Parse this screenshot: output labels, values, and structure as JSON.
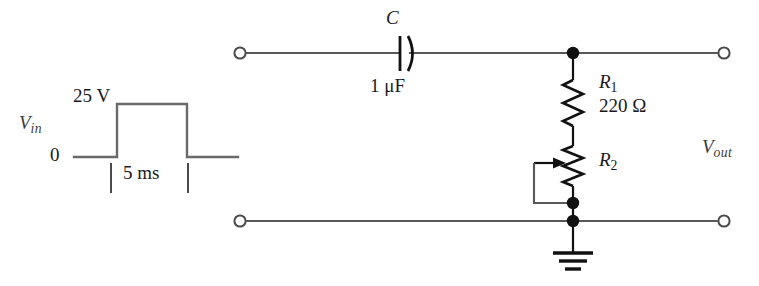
{
  "figure": {
    "colors": {
      "wire": "#595959",
      "component": "#111111",
      "label": "#3c3c3c",
      "background": "#ffffff"
    }
  },
  "waveform": {
    "signal_label": "V",
    "signal_label_sub": "in",
    "high_level": "25 V",
    "low_level": "0",
    "pulse_width": "5 ms",
    "type": "rectangular-pulse"
  },
  "circuit": {
    "capacitor": {
      "designator": "C",
      "value": "1 μF",
      "symbol": "capacitor-polarized"
    },
    "resistor_1": {
      "designator": "R",
      "designator_sub": "1",
      "value": "220 Ω",
      "symbol": "resistor-zigzag"
    },
    "resistor_2": {
      "designator": "R",
      "designator_sub": "2",
      "value": "",
      "symbol": "potentiometer"
    },
    "output": {
      "label": "V",
      "label_sub": "out"
    },
    "ground": {
      "symbol": "earth-ground"
    },
    "terminals": [
      {
        "name": "input-top-terminal"
      },
      {
        "name": "input-bottom-terminal"
      },
      {
        "name": "output-top-terminal"
      },
      {
        "name": "output-bottom-terminal"
      }
    ],
    "nodes": [
      {
        "name": "top-junction-node"
      },
      {
        "name": "wiper-junction-node"
      },
      {
        "name": "ground-junction-node"
      }
    ]
  }
}
